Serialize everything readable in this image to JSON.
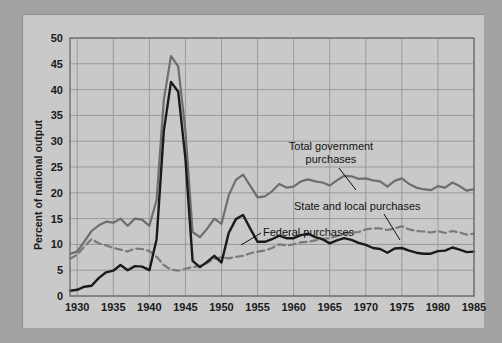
{
  "figure": {
    "background_color": "#a3a3a3",
    "panel_color": "#c9c9c9",
    "plot_color": "#c9c9c9"
  },
  "chart_data": {
    "type": "line",
    "title": "",
    "xlabel": "",
    "ylabel": "Percent of national output",
    "xlim": [
      1929,
      1985
    ],
    "ylim": [
      0,
      50
    ],
    "xticks": [
      "1930",
      "1935",
      "1940",
      "1945",
      "1950",
      "1955",
      "1960",
      "1965",
      "1970",
      "1975",
      "1980",
      "1985"
    ],
    "yticks": [
      "0",
      "5",
      "10",
      "15",
      "20",
      "25",
      "30",
      "35",
      "40",
      "45",
      "50"
    ],
    "grid": true,
    "legend": "inline-annotations",
    "annotations": [
      {
        "label": "Total government purchases",
        "series": "total_government_purchases"
      },
      {
        "label": "State and local purchases",
        "series": "state_and_local_purchases"
      },
      {
        "label": "Federal purchases",
        "series": "federal_purchases"
      }
    ],
    "x": [
      1929,
      1930,
      1931,
      1932,
      1933,
      1934,
      1935,
      1936,
      1937,
      1938,
      1939,
      1940,
      1941,
      1942,
      1943,
      1944,
      1945,
      1946,
      1947,
      1948,
      1949,
      1950,
      1951,
      1952,
      1953,
      1954,
      1955,
      1956,
      1957,
      1958,
      1959,
      1960,
      1961,
      1962,
      1963,
      1964,
      1965,
      1966,
      1967,
      1968,
      1969,
      1970,
      1971,
      1972,
      1973,
      1974,
      1975,
      1976,
      1977,
      1978,
      1979,
      1980,
      1981,
      1982,
      1983,
      1984,
      1985
    ],
    "series": [
      {
        "name": "Total government purchases",
        "color": "#6e6e6e",
        "style": "solid",
        "width": 2.2,
        "values": [
          8.2,
          8.6,
          10.6,
          12.6,
          13.7,
          14.4,
          14.2,
          15.0,
          13.6,
          15.0,
          14.8,
          13.6,
          18.6,
          38.0,
          46.5,
          44.5,
          32.0,
          12.4,
          11.4,
          13.0,
          15.0,
          14.0,
          19.5,
          22.5,
          23.5,
          21.3,
          19.1,
          19.3,
          20.3,
          21.7,
          21.0,
          21.2,
          22.2,
          22.6,
          22.2,
          22.0,
          21.4,
          22.4,
          23.3,
          23.2,
          22.7,
          22.8,
          22.4,
          22.2,
          21.2,
          22.3,
          22.8,
          21.7,
          21.0,
          20.7,
          20.5,
          21.3,
          21.0,
          22.0,
          21.3,
          20.4,
          20.7
        ]
      },
      {
        "name": "State and local purchases",
        "color": "#7a7a7a",
        "style": "dashed",
        "width": 2.2,
        "values": [
          7.2,
          8.0,
          9.6,
          11.0,
          10.2,
          9.8,
          9.3,
          9.0,
          8.6,
          9.2,
          9.1,
          8.7,
          7.6,
          6.0,
          5.1,
          4.9,
          5.3,
          5.6,
          5.8,
          6.4,
          7.2,
          7.5,
          7.3,
          7.6,
          7.8,
          8.3,
          8.6,
          8.8,
          9.3,
          10.0,
          9.8,
          10.0,
          10.4,
          10.5,
          10.8,
          11.0,
          11.2,
          11.6,
          12.1,
          12.3,
          12.4,
          12.9,
          13.1,
          13.1,
          12.8,
          13.1,
          13.5,
          12.9,
          12.6,
          12.5,
          12.3,
          12.6,
          12.2,
          12.6,
          12.3,
          11.9,
          12.1
        ]
      },
      {
        "name": "Federal purchases",
        "color": "#1a1a1a",
        "style": "solid",
        "width": 2.4,
        "values": [
          1.0,
          1.2,
          1.8,
          2.0,
          3.5,
          4.6,
          4.9,
          6.0,
          5.0,
          5.8,
          5.7,
          5.0,
          11.0,
          32.0,
          41.5,
          39.6,
          26.7,
          6.8,
          5.6,
          6.6,
          7.8,
          6.5,
          12.2,
          14.9,
          15.7,
          13.0,
          10.5,
          10.5,
          11.0,
          11.7,
          11.2,
          11.2,
          11.8,
          12.1,
          11.4,
          11.0,
          10.2,
          10.8,
          11.2,
          10.9,
          10.3,
          9.9,
          9.3,
          9.1,
          8.4,
          9.2,
          9.3,
          8.8,
          8.4,
          8.2,
          8.2,
          8.7,
          8.8,
          9.4,
          9.0,
          8.5,
          8.6
        ]
      }
    ]
  }
}
